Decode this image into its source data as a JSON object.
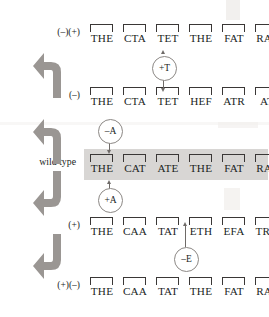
{
  "figure": {
    "highlight_color": "#d8d6d4",
    "arrow_color": "#9a9693",
    "text_color": "#201e1d"
  },
  "rows": [
    {
      "label": "(–)(+)",
      "id": "minus-plus",
      "highlighted": false,
      "codons": [
        "THE",
        "CTA",
        "TET",
        "THE",
        "FAT",
        "RAT"
      ]
    },
    {
      "label": "(–)",
      "id": "minus",
      "highlighted": false,
      "codons": [
        "THE",
        "CTA",
        "TET",
        "HEF",
        "ATR",
        "AT"
      ]
    },
    {
      "label": "wild type",
      "id": "wild-type",
      "highlighted": true,
      "codons": [
        "THE",
        "CAT",
        "ATE",
        "THE",
        "FAT",
        "RAT"
      ]
    },
    {
      "label": "(+)",
      "id": "plus",
      "highlighted": false,
      "codons": [
        "THE",
        "CAA",
        "TAT",
        "ETH",
        "EFA",
        "TRA"
      ]
    },
    {
      "label": "(+)(–)",
      "id": "plus-minus",
      "highlighted": false,
      "codons": [
        "THE",
        "CAA",
        "TAT",
        "THE",
        "FAT",
        "RAT"
      ]
    }
  ],
  "mutations": [
    {
      "id": "insert-t",
      "label": "+T",
      "direction": "up"
    },
    {
      "id": "delete-a",
      "label": "–A",
      "direction": "down"
    },
    {
      "id": "insert-a",
      "label": "+A",
      "direction": "up"
    },
    {
      "id": "delete-e",
      "label": "–E",
      "direction": "up"
    }
  ],
  "flow_arrows": [
    {
      "id": "arrow-minus-to-minusplus",
      "direction": "up"
    },
    {
      "id": "arrow-wildtype-to-minus",
      "direction": "up"
    },
    {
      "id": "arrow-wildtype-to-plus",
      "direction": "down"
    },
    {
      "id": "arrow-plus-to-plusminus",
      "direction": "down"
    }
  ]
}
